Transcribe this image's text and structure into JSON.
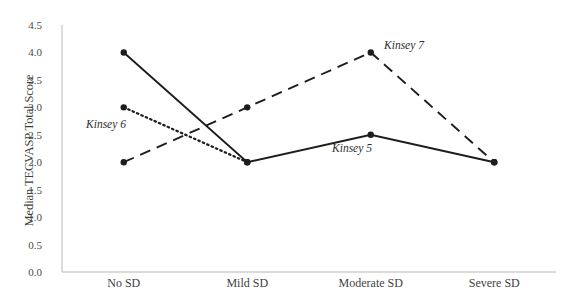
{
  "chart_data": {
    "type": "line",
    "title": "",
    "xlabel": "",
    "ylabel": "Median TECVASP Total Score",
    "categories": [
      "No SD",
      "Mild SD",
      "Moderate SD",
      "Severe SD"
    ],
    "ylim": [
      0.0,
      4.5
    ],
    "yticks": [
      "0.0",
      "0.5",
      "1.0",
      "1.5",
      "2.0",
      "2.5",
      "3.0",
      "3.5",
      "4.0",
      "4.5"
    ],
    "grid": false,
    "legend_position": "inline-annotations",
    "series": [
      {
        "name": "Kinsey 5",
        "style": "solid",
        "color": "#1d1d1d",
        "values": [
          4.0,
          2.0,
          2.5,
          2.0
        ]
      },
      {
        "name": "Kinsey 6",
        "style": "dotted",
        "color": "#1d1d1d",
        "values": [
          3.0,
          2.0,
          null,
          null
        ]
      },
      {
        "name": "Kinsey 7",
        "style": "dashed",
        "color": "#1d1d1d",
        "values": [
          2.0,
          3.0,
          4.0,
          2.0
        ]
      }
    ],
    "annotations": [
      {
        "text": "Kinsey 6",
        "series": "Kinsey 6",
        "x_px": 106,
        "y_px": 124
      },
      {
        "text": "Kinsey 7",
        "series": "Kinsey 7",
        "x_px": 404,
        "y_px": 45
      },
      {
        "text": "Kinsey 5",
        "series": "Kinsey 5",
        "x_px": 352,
        "y_px": 148
      }
    ]
  },
  "axis": {
    "line_color": "#b8b8b8"
  }
}
